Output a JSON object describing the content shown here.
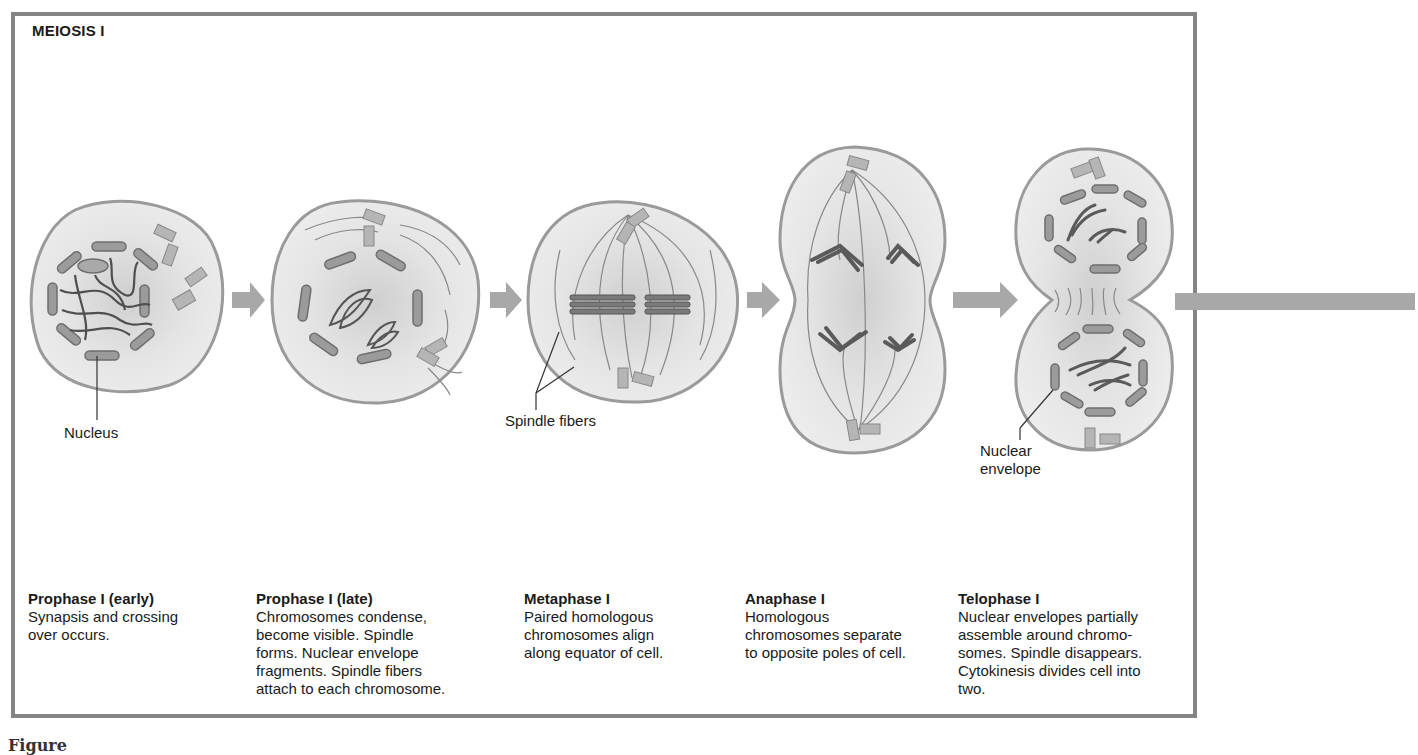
{
  "figure": {
    "title": "MEIOSIS I",
    "figure_label": "Figure"
  },
  "labels": {
    "nucleus": "Nucleus",
    "spindle_fibers": "Spindle fibers",
    "nuclear_envelope_1": "Nuclear",
    "nuclear_envelope_2": "envelope"
  },
  "stages": [
    {
      "name": "Prophase I (early)",
      "description": "Synapsis and crossing\nover occurs."
    },
    {
      "name": "Prophase I (late)",
      "description": "Chromosomes condense,\nbecome visible. Spindle\nforms. Nuclear envelope\nfragments. Spindle fibers\nattach to each chromosome."
    },
    {
      "name": "Metaphase I",
      "description": "Paired homologous\nchromosomes align\nalong equator of cell."
    },
    {
      "name": "Anaphase I",
      "description": "Homologous\nchromosomes separate\nto opposite poles of cell."
    },
    {
      "name": "Telophase I",
      "description": "Nuclear envelopes partially\nassemble around chromo-\nsomes. Spindle disappears.\nCytokinesis divides cell into\ntwo."
    }
  ],
  "colors": {
    "frame": "#858585",
    "cell_fill": "#e6e6e6",
    "cell_outline": "#9a9a9a",
    "chromosome": "#6e6e6e",
    "arrow": "#a8a8a8"
  }
}
